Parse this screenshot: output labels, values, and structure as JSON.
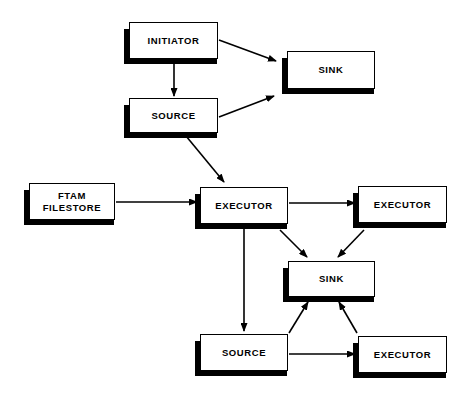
{
  "diagram": {
    "canvas": {
      "width": 472,
      "height": 400,
      "background": "#ffffff"
    },
    "style": {
      "box_fill": "#ffffff",
      "box_stroke": "#000000",
      "shadow": "#000000",
      "text": "#000000"
    },
    "nodes": [
      {
        "id": "initiator",
        "label": "INITIATOR",
        "x": 129,
        "y": 22,
        "w": 89,
        "h": 37
      },
      {
        "id": "sink-top",
        "label": "SINK",
        "x": 287,
        "y": 51,
        "w": 88,
        "h": 38
      },
      {
        "id": "source-top",
        "label": "SOURCE",
        "x": 129,
        "y": 98,
        "w": 89,
        "h": 35
      },
      {
        "id": "ftam-filestore",
        "label": "FTAM\nFILESTORE",
        "x": 29,
        "y": 183,
        "w": 86,
        "h": 37
      },
      {
        "id": "executor-mid",
        "label": "EXECUTOR",
        "x": 200,
        "y": 187,
        "w": 88,
        "h": 37
      },
      {
        "id": "executor-right",
        "label": "EXECUTOR",
        "x": 358,
        "y": 186,
        "w": 89,
        "h": 37
      },
      {
        "id": "sink-bottom",
        "label": "SINK",
        "x": 288,
        "y": 261,
        "w": 87,
        "h": 36
      },
      {
        "id": "source-bottom",
        "label": "SOURCE",
        "x": 200,
        "y": 334,
        "w": 88,
        "h": 37
      },
      {
        "id": "executor-bottom",
        "label": "EXECUTOR",
        "x": 358,
        "y": 336,
        "w": 89,
        "h": 37
      }
    ],
    "edges": [
      {
        "id": "initiator-to-sink-top",
        "from": "initiator",
        "to": "sink-top",
        "points": "219,40 276,61"
      },
      {
        "id": "initiator-to-source-top",
        "from": "initiator",
        "to": "source-top",
        "points": "174,60 174,96"
      },
      {
        "id": "source-top-to-sink-top",
        "from": "source-top",
        "to": "sink-top",
        "points": "219,117 274,96"
      },
      {
        "id": "source-top-to-executor-mid",
        "from": "source-top",
        "to": "executor-mid",
        "points": "186,136 224,182"
      },
      {
        "id": "ftam-to-executor-mid",
        "from": "ftam-filestore",
        "to": "executor-mid",
        "points": "116,202 197,202"
      },
      {
        "id": "executor-mid-to-executor-right",
        "from": "executor-mid",
        "to": "executor-right",
        "points": "289,203 355,203"
      },
      {
        "id": "executor-mid-to-source-bottom",
        "from": "executor-mid",
        "to": "source-bottom",
        "points": "244,225 244,331"
      },
      {
        "id": "executor-mid-to-sink-bottom",
        "from": "executor-mid",
        "to": "sink-bottom",
        "points": "280,230 307,257"
      },
      {
        "id": "executor-right-to-sink-bottom",
        "from": "executor-right",
        "to": "sink-bottom",
        "points": "364,230 338,257"
      },
      {
        "id": "source-bottom-to-sink-bottom",
        "from": "source-bottom",
        "to": "sink-bottom",
        "points": "289,333 308,302"
      },
      {
        "id": "executor-bottom-to-sink-bottom",
        "from": "executor-bottom",
        "to": "sink-bottom",
        "points": "357,333 339,302"
      },
      {
        "id": "source-bottom-to-executor-bottom",
        "from": "source-bottom",
        "to": "executor-bottom",
        "points": "289,354 355,354"
      }
    ]
  }
}
